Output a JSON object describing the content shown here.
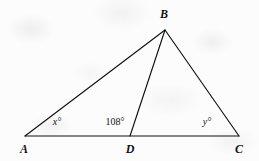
{
  "figure": {
    "type": "geometry-diagram",
    "stroke_color": "#111111",
    "background_color": "#fcfcfc",
    "points": {
      "A": {
        "label": "A",
        "x": 25,
        "y": 136,
        "label_x": 24,
        "label_y": 143
      },
      "B": {
        "label": "B",
        "x": 165,
        "y": 30,
        "label_x": 164,
        "label_y": 8
      },
      "C": {
        "label": "C",
        "x": 239,
        "y": 136,
        "label_x": 239,
        "label_y": 143
      },
      "D": {
        "label": "D",
        "x": 130,
        "y": 136,
        "label_x": 130,
        "label_y": 143
      }
    },
    "segments": [
      {
        "name": "segment-AB",
        "from": "A",
        "to": "B"
      },
      {
        "name": "segment-BC",
        "from": "B",
        "to": "C"
      },
      {
        "name": "segment-BD",
        "from": "B",
        "to": "D"
      },
      {
        "name": "segment-AC",
        "from": "A",
        "to": "C"
      }
    ],
    "angle_labels": [
      {
        "name": "angle-A",
        "text": "x°",
        "style": "italic",
        "x": 57,
        "y": 117
      },
      {
        "name": "angle-BDA",
        "text": "108°",
        "style": "upright",
        "x": 115,
        "y": 117
      },
      {
        "name": "angle-C",
        "text": "y°",
        "style": "italic",
        "x": 207,
        "y": 117
      }
    ]
  }
}
